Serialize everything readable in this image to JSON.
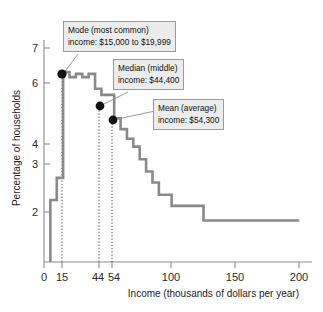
{
  "chart_data": {
    "type": "line",
    "title": "",
    "xlabel": "Income (thousands of dollars per year)",
    "ylabel": "Percentage of households",
    "xlim": [
      0,
      210
    ],
    "ylim": [
      0,
      7.6
    ],
    "grid": false,
    "legend_position": "none",
    "x_ticks": [
      {
        "value": 0,
        "label": "0"
      },
      {
        "value": 15,
        "label": "15"
      },
      {
        "value": 44,
        "label": "44"
      },
      {
        "value": 54,
        "label": "54"
      },
      {
        "value": 100,
        "label": "100"
      },
      {
        "value": 150,
        "label": "150"
      },
      {
        "value": 200,
        "label": "200"
      }
    ],
    "y_ticks": [
      {
        "value": 2,
        "label": "2"
      },
      {
        "value": 3,
        "label": "3"
      },
      {
        "value": 4,
        "label": "4"
      },
      {
        "value": 6,
        "label": "6"
      },
      {
        "value": 7,
        "label": "7"
      }
    ],
    "series": [
      {
        "name": "Percentage of households by income bracket",
        "step": "post",
        "points": [
          {
            "x": 5,
            "y": 2.12
          },
          {
            "x": 10,
            "y": 2.88
          },
          {
            "x": 15,
            "y": 6.5
          },
          {
            "x": 20,
            "y": 6.33
          },
          {
            "x": 25,
            "y": 6.44
          },
          {
            "x": 30,
            "y": 6.33
          },
          {
            "x": 35,
            "y": 6.44
          },
          {
            "x": 40,
            "y": 5.93
          },
          {
            "x": 45,
            "y": 5.72
          },
          {
            "x": 50,
            "y": 5.72
          },
          {
            "x": 55,
            "y": 4.92
          },
          {
            "x": 60,
            "y": 4.55
          },
          {
            "x": 65,
            "y": 4.22
          },
          {
            "x": 70,
            "y": 3.95
          },
          {
            "x": 75,
            "y": 3.52
          },
          {
            "x": 80,
            "y": 3.1
          },
          {
            "x": 85,
            "y": 2.72
          },
          {
            "x": 90,
            "y": 2.3
          },
          {
            "x": 100,
            "y": 1.92
          },
          {
            "x": 125,
            "y": 1.42
          },
          {
            "x": 200,
            "y": 1.42
          }
        ]
      }
    ],
    "annotations": [
      {
        "name": "mode",
        "line1": "Mode (most common)",
        "line2": "income: $15,000 to $19,999",
        "marker_x": 15,
        "marker_y": 6.5,
        "guide_line": true
      },
      {
        "name": "median",
        "line1": "Median (middle)",
        "line2": "income: $44,400",
        "marker_x": 44,
        "marker_y": 5.93,
        "guide_line": true
      },
      {
        "name": "mean",
        "line1": "Mean (average)",
        "line2": "income: $54,300",
        "marker_x": 54,
        "marker_y": 5.72,
        "guide_line": true
      }
    ],
    "colors": {
      "curve": "#8a8a8a",
      "axis": "#8b8b8b",
      "marker": "#121212",
      "callout_background": "#ececec",
      "callout_border": "#9a9a9a"
    }
  }
}
